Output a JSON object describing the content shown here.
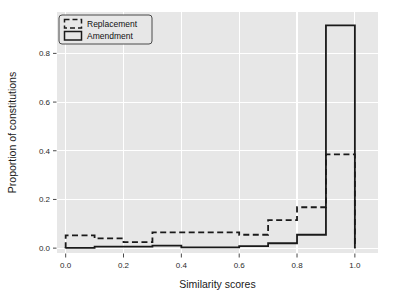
{
  "chart_data": {
    "type": "line",
    "style": "step-histogram-outline",
    "title": "",
    "xlabel": "Similarity scores",
    "ylabel": "Proportion of constitutions",
    "xlim": [
      -0.03,
      1.08
    ],
    "ylim": [
      -0.02,
      0.97
    ],
    "xticks": [
      0.0,
      0.2,
      0.4,
      0.6,
      0.8,
      1.0
    ],
    "xtick_labels": [
      "0.0",
      "0.2",
      "0.4",
      "0.6",
      "0.8",
      "1.0"
    ],
    "yticks": [
      0.0,
      0.2,
      0.4,
      0.6,
      0.8
    ],
    "ytick_labels": [
      "0.0",
      "0.2",
      "0.4",
      "0.6",
      "0.8"
    ],
    "grid": true,
    "grid_color": "#ffffff",
    "plot_bgcolor": "#e7e7e7",
    "fig_bgcolor": "#ffffff",
    "legend_position": "upper left",
    "bin_edges": [
      0.0,
      0.1,
      0.2,
      0.3,
      0.4,
      0.5,
      0.6,
      0.7,
      0.8,
      0.9,
      1.0
    ],
    "series": [
      {
        "name": "Replacement",
        "linestyle": "dashed",
        "color": "#1a1a1a",
        "linewidth": 1.8,
        "values": [
          0.052,
          0.04,
          0.025,
          0.065,
          0.065,
          0.065,
          0.055,
          0.115,
          0.168,
          0.385
        ]
      },
      {
        "name": "Amendment",
        "linestyle": "solid",
        "color": "#1a1a1a",
        "linewidth": 1.8,
        "values": [
          0.001,
          0.006,
          0.006,
          0.01,
          0.003,
          0.003,
          0.008,
          0.02,
          0.055,
          0.915
        ]
      }
    ]
  },
  "legend": {
    "entries": [
      {
        "label": "Replacement",
        "swatch": "dashed-rect-icon"
      },
      {
        "label": "Amendment",
        "swatch": "solid-rect-icon"
      }
    ]
  },
  "axes": {
    "xlabel": "Similarity scores",
    "ylabel": "Proportion of constitutions"
  }
}
